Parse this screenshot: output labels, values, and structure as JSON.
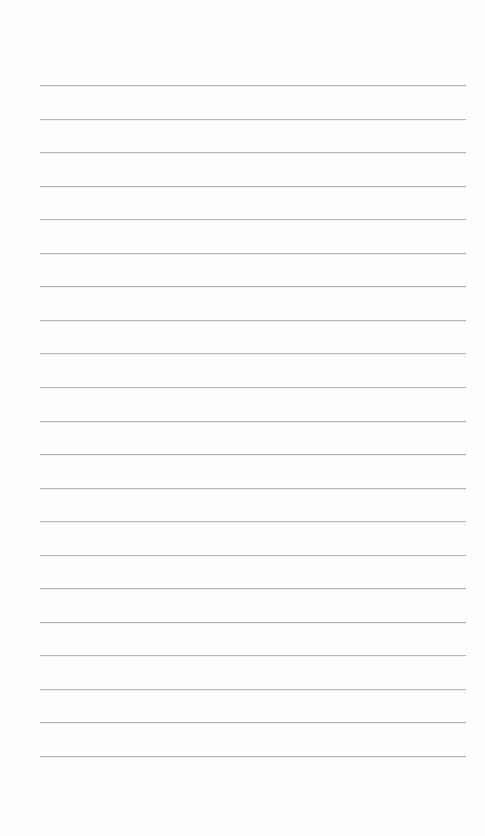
{
  "page": {
    "type": "lined-paper",
    "background_color": "#fefefe",
    "line_color": "#b4b4b4",
    "line_count": 21,
    "first_line_y": 85,
    "line_spacing": 33.55,
    "line_left": 40,
    "line_right": 466,
    "lines": [
      {
        "text": ""
      },
      {
        "text": ""
      },
      {
        "text": ""
      },
      {
        "text": ""
      },
      {
        "text": ""
      },
      {
        "text": ""
      },
      {
        "text": ""
      },
      {
        "text": ""
      },
      {
        "text": ""
      },
      {
        "text": ""
      },
      {
        "text": ""
      },
      {
        "text": ""
      },
      {
        "text": ""
      },
      {
        "text": ""
      },
      {
        "text": ""
      },
      {
        "text": ""
      },
      {
        "text": ""
      },
      {
        "text": ""
      },
      {
        "text": ""
      },
      {
        "text": ""
      },
      {
        "text": ""
      }
    ]
  }
}
